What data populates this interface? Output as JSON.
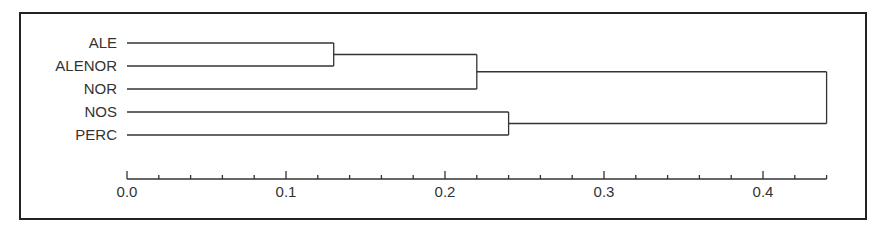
{
  "chart_data": {
    "type": "dendrogram",
    "title": "",
    "xlabel": "",
    "ylabel": "",
    "orientation": "horizontal",
    "leaves": [
      "ALE",
      "ALENOR",
      "NOR",
      "NOS",
      "PERC"
    ],
    "merges": [
      {
        "left": "ALE",
        "right": "ALENOR",
        "height": 0.13
      },
      {
        "left": "ALE+ALENOR",
        "right": "NOR",
        "height": 0.22
      },
      {
        "left": "NOS",
        "right": "PERC",
        "height": 0.24
      },
      {
        "left": "ALE+ALENOR+NOR",
        "right": "NOS+PERC",
        "height": 0.44
      }
    ],
    "xlim": [
      0.0,
      0.44
    ],
    "x_ticks_major": [
      "0.0",
      "0.1",
      "0.2",
      "0.3",
      "0.4"
    ],
    "x_tick_minor_step": 0.02,
    "grid": false,
    "legend": null
  },
  "colors": {
    "line": "#333333",
    "frame": "#222222",
    "background": "#ffffff"
  }
}
